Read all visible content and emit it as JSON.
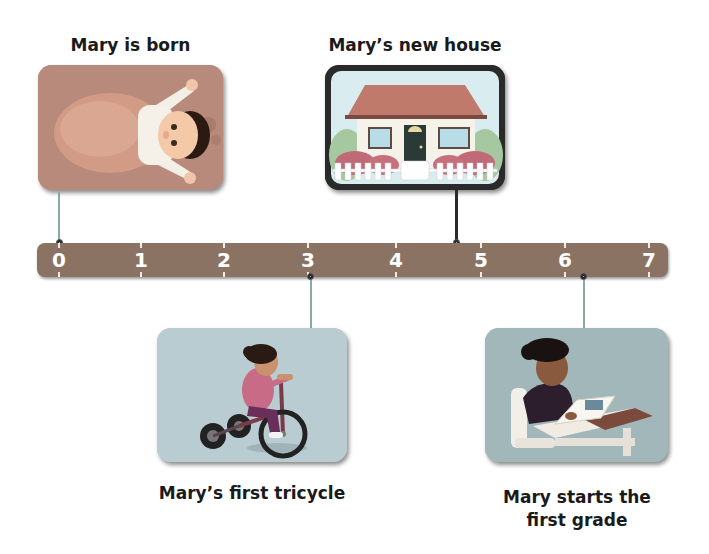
{
  "timeline": {
    "axis": {
      "ticks": [
        "0",
        "1",
        "2",
        "3",
        "4",
        "5",
        "6",
        "7"
      ],
      "bar_color": "#8b7364"
    },
    "events": [
      {
        "id": "born",
        "label": "Mary is born",
        "position": 0,
        "placement": "above",
        "image": "baby-swaddled-illustration"
      },
      {
        "id": "house",
        "label": "Mary’s new house",
        "position": 4.7,
        "placement": "above",
        "image": "house-with-picket-fence-illustration"
      },
      {
        "id": "tricycle",
        "label": "Mary’s first tricycle",
        "position": 3.0,
        "placement": "below",
        "image": "girl-riding-tricycle-illustration"
      },
      {
        "id": "grade",
        "label_line1": "Mary starts the",
        "label_line2": "first grade",
        "position": 6.2,
        "placement": "below",
        "image": "girl-reading-at-desk-illustration"
      }
    ]
  },
  "colors": {
    "card_born": "#b78a7b",
    "card_house_sky": "#d9ecef",
    "card_tricycle": "#b8ccd1",
    "card_grade": "#a2b7b9",
    "connector": "#8fa6a8",
    "connector_dark": "#2a2a2a",
    "text": "#1a1a1a"
  }
}
